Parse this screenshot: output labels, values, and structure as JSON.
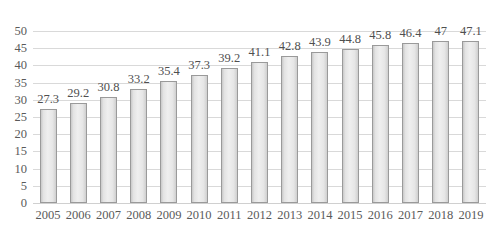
{
  "chart_data": {
    "type": "bar",
    "title": "",
    "subtitle": "",
    "xlabel": "",
    "ylabel": "",
    "categories": [
      "2005",
      "2006",
      "2007",
      "2008",
      "2009",
      "2010",
      "2011",
      "2012",
      "2013",
      "2014",
      "2015",
      "2016",
      "2017",
      "2018",
      "2019"
    ],
    "values": [
      27.3,
      29.2,
      30.8,
      33.2,
      35.4,
      37.3,
      39.2,
      41.1,
      42.8,
      43.9,
      44.8,
      45.8,
      46.4,
      47,
      47.1
    ],
    "value_labels": [
      "27.3",
      "29.2",
      "30.8",
      "33.2",
      "35.4",
      "37.3",
      "39.2",
      "41.1",
      "42.8",
      "43.9",
      "44.8",
      "45.8",
      "46.4",
      "47",
      "47.1"
    ],
    "ylim": [
      0,
      50
    ],
    "ytick_step": 5,
    "yticks": [
      0,
      5,
      10,
      15,
      20,
      25,
      30,
      35,
      40,
      45,
      50
    ],
    "ytick_labels": [
      "0",
      "5",
      "10",
      "15",
      "20",
      "25",
      "30",
      "35",
      "40",
      "45",
      "50"
    ],
    "grid": "horizontal",
    "legend": "none",
    "series": [
      {
        "name": "",
        "values": [
          27.3,
          29.2,
          30.8,
          33.2,
          35.4,
          37.3,
          39.2,
          41.1,
          42.8,
          43.9,
          44.8,
          45.8,
          46.4,
          47,
          47.1
        ]
      }
    ],
    "colors": {
      "bar_fill_light": "#efefef",
      "bar_fill_edge": "#c9c9c9",
      "bar_border": "#9a9a9a",
      "gridline": "#d9d9d9",
      "text": "#5a5a5a",
      "background": "#ffffff"
    }
  }
}
